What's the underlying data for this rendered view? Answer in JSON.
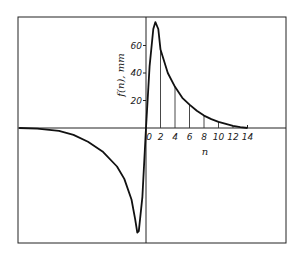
{
  "chart_data": {
    "type": "line",
    "title": "",
    "xlabel": "n",
    "ylabel": "f(n), mm",
    "x_ticks": [
      0,
      2,
      4,
      6,
      8,
      10,
      12,
      14
    ],
    "y_ticks": [
      20,
      40,
      60
    ],
    "xlim": [
      -17.5,
      19
    ],
    "ylim": [
      -82,
      82
    ],
    "grid": false,
    "legend": null,
    "series": [
      {
        "name": "f(n)",
        "x": [
          -17.5,
          -15,
          -12,
          -10,
          -8,
          -6,
          -4,
          -3,
          -2,
          -1.5,
          -1.2,
          -1,
          -0.5,
          0,
          0.5,
          1,
          1.3,
          1.7,
          2,
          3,
          4,
          5,
          6,
          7,
          8,
          9,
          10,
          11,
          12,
          13,
          14
        ],
        "y": [
          0,
          -0.5,
          -2,
          -5,
          -10,
          -17,
          -28,
          -37,
          -52,
          -66,
          -76,
          -75,
          -50,
          0,
          45,
          72,
          77,
          72,
          57,
          40,
          30,
          22,
          17,
          12.5,
          9,
          6.5,
          4.5,
          3,
          1.5,
          0.6,
          0
        ]
      }
    ],
    "stems": {
      "x": [
        2,
        4,
        6,
        8,
        10,
        12
      ],
      "y": [
        57,
        30,
        17,
        9,
        4.5,
        1.5
      ]
    },
    "annotations": []
  }
}
